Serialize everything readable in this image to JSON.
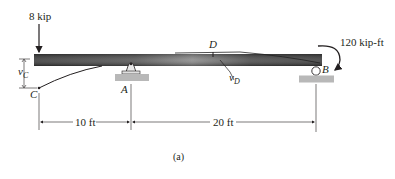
{
  "figure": {
    "caption": "(a)",
    "colors": {
      "ink": "#231f20",
      "beam_dark": "#3a3a3a",
      "beam_light": "#8a8a8a",
      "support_fill": "#b8b8b8"
    }
  },
  "loads": {
    "point_load": {
      "label": "8 kip",
      "location": "C",
      "direction": "down"
    },
    "moment": {
      "label": "120 kip·ft",
      "display": "120 kip-ft",
      "location": "B",
      "direction": "clockwise"
    }
  },
  "points": {
    "A": {
      "label": "A",
      "support": "pin"
    },
    "B": {
      "label": "B",
      "support": "roller"
    },
    "C": {
      "label": "C",
      "type": "free end"
    },
    "D": {
      "label": "D",
      "type": "point of max deflection"
    }
  },
  "deflections": {
    "vC": {
      "main": "v",
      "sub": "C"
    },
    "vD": {
      "main": "v",
      "sub": "D"
    }
  },
  "dimensions": [
    {
      "label": "10 ft",
      "from": "C",
      "to": "A"
    },
    {
      "label": "20 ft",
      "from": "A",
      "to": "B"
    }
  ]
}
